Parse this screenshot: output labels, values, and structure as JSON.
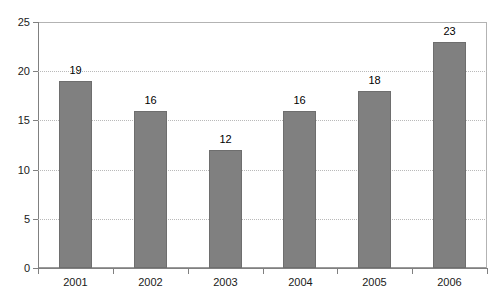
{
  "chart_data": {
    "type": "bar",
    "title": "",
    "subtitle": "",
    "xlabel": "",
    "ylabel": "",
    "categories": [
      "2001",
      "2002",
      "2003",
      "2004",
      "2005",
      "2006"
    ],
    "values": [
      19,
      16,
      12,
      16,
      18,
      23
    ],
    "data_labels": [
      "19",
      "16",
      "12",
      "16",
      "18",
      "23"
    ],
    "ylim": [
      0,
      25
    ],
    "ytick_labels": [
      "0",
      "5",
      "10",
      "15",
      "20",
      "25"
    ],
    "ytick_values": [
      0,
      5,
      10,
      15,
      20,
      25
    ],
    "grid": "horizontal-dotted",
    "legend": "none",
    "bar_color": "#808080",
    "bar_border_color": "#6e6e6e",
    "gridline_color": "#b9b9b9",
    "axis_color": "#808080",
    "background": "#ffffff"
  }
}
